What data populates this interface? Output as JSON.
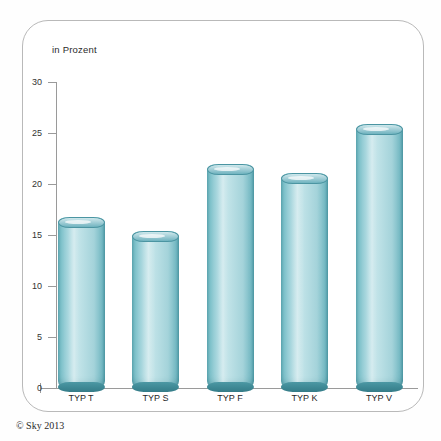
{
  "chart_data": {
    "type": "bar",
    "title": "",
    "subtitle": "",
    "unit_label": "in Prozent",
    "xlabel": "",
    "ylabel": "",
    "categories": [
      "TYP T",
      "TYP S",
      "TYP F",
      "TYP K",
      "TYP V"
    ],
    "values": [
      16.8,
      15.4,
      22.0,
      21.1,
      25.9
    ],
    "ylim": [
      0,
      30
    ],
    "yticks": [
      0,
      5,
      10,
      15,
      20,
      25,
      30
    ],
    "ytick_labels": [
      "0",
      "5",
      "10",
      "15",
      "20",
      "25",
      "30"
    ],
    "grid": false,
    "legend": null,
    "series": [
      {
        "name": "Anteil in Prozent",
        "values": [
          16.8,
          15.4,
          22.0,
          21.1,
          25.9
        ]
      }
    ],
    "bar_style": "3d-cylinder",
    "colors": {
      "bar_light": "#bfe2e7",
      "bar_mid": "#8dc7d0",
      "bar_dark": "#4f9aa6",
      "bar_rim": "#3d8793",
      "axis": "#9a9a9a",
      "panel_border": "#b9b9b9",
      "text": "#1f1f1f",
      "background": "#ffffff"
    }
  },
  "footer": {
    "copyright": "© Sky 2013"
  }
}
